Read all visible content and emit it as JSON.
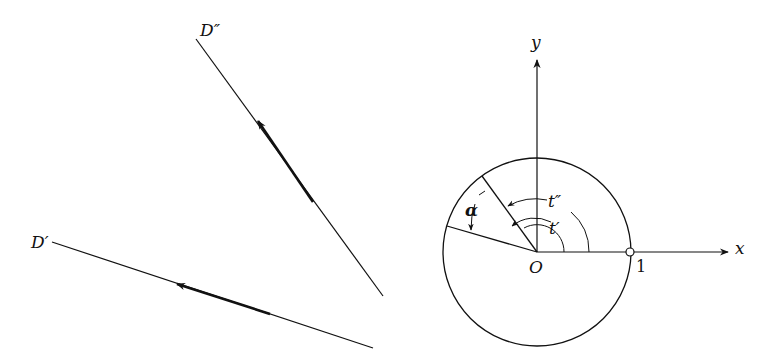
{
  "left_panel": {
    "line_d_double_prime": {
      "label": "D″",
      "start": [
        196,
        39
      ],
      "end": [
        383,
        296
      ],
      "arrow_at": [
        257,
        120
      ],
      "thick_to": [
        313,
        202
      ]
    },
    "line_d_prime": {
      "label": "D′",
      "start": [
        52,
        242
      ],
      "end": [
        373,
        348
      ],
      "arrow_at": [
        177,
        284
      ],
      "thick_to": [
        270,
        314
      ]
    }
  },
  "right_panel": {
    "origin": {
      "label": "O",
      "x": 537,
      "y": 252
    },
    "circle_radius": 94,
    "x_axis": {
      "label": "x",
      "end": [
        728,
        252
      ]
    },
    "y_axis": {
      "label": "y",
      "end": [
        537,
        60
      ]
    },
    "unit_point": {
      "label": "1",
      "x": 630,
      "y": 252
    },
    "angle_t_prime": {
      "label": "t′"
    },
    "angle_t_double_prime": {
      "label": "t″"
    },
    "angle_alpha": {
      "label": "α"
    }
  },
  "colors": {
    "ink": "#111111",
    "background": "#ffffff"
  }
}
